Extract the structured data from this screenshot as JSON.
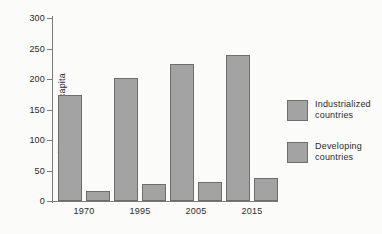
{
  "chart_data": {
    "type": "bar",
    "title": "",
    "xlabel": "",
    "ylabel": "Million Btu per capita",
    "categories": [
      "1970",
      "1995",
      "2005",
      "2015"
    ],
    "ylim": [
      0,
      300
    ],
    "yticks": [
      0,
      50,
      100,
      150,
      200,
      250,
      300
    ],
    "ytick_labels": [
      "0",
      "50",
      "100",
      "150",
      "200",
      "250",
      "300"
    ],
    "grid": false,
    "legend_position": "right",
    "series": [
      {
        "name": "Industrialized countries",
        "name_line1": "Industrialized",
        "name_line2": "countries",
        "values": [
          174,
          202,
          224,
          240
        ],
        "color": "#a3a3a3"
      },
      {
        "name": "Developing countries",
        "name_line1": "Developing",
        "name_line2": "countries",
        "values": [
          17,
          28,
          31,
          38
        ],
        "color": "#a3a3a3"
      }
    ]
  },
  "colors": {
    "bar_fill": "#a3a3a3",
    "bar_border": "#6e6e6e",
    "axis": "#7a7a7a",
    "text": "#2b2b2b",
    "background": "#fbfbf9"
  }
}
